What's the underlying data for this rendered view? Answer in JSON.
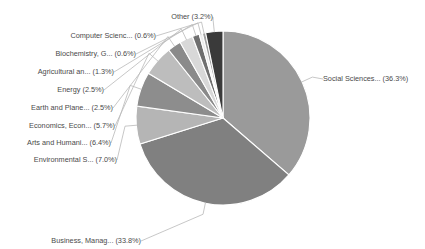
{
  "chart_data": {
    "type": "pie",
    "title": "",
    "subtitle": "",
    "xlabel": "",
    "ylabel": "",
    "legend_position": "none",
    "grid": false,
    "start_angle_deg": 90,
    "direction": "clockwise",
    "value_unit": "percent",
    "categories": [
      "Social Sciences...",
      "Business, Manag...",
      "Environmental S...",
      "Arts and Humani...",
      "Economics, Econ...",
      "Earth and Plane...",
      "Energy",
      "Agricultural an...",
      "Biochemistry, G...",
      "Computer Scienc...",
      "Other"
    ],
    "values": [
      36.3,
      33.8,
      7.0,
      6.4,
      5.7,
      2.5,
      2.5,
      1.3,
      0.6,
      0.6,
      3.2
    ],
    "colors": [
      "#9a9a9a",
      "#808080",
      "#b5b5b5",
      "#8d8d8d",
      "#bdbdbd",
      "#8a8a8a",
      "#d8d8d8",
      "#6f6f6f",
      "#ededed",
      "#a0a0a0",
      "#3a3a3a"
    ],
    "slices": [
      {
        "label": "Social Sciences...",
        "percent": "36.3%",
        "display": "Social Sciences... (36.3%)",
        "color": "#9a9a9a"
      },
      {
        "label": "Business, Manag...",
        "percent": "33.8%",
        "display": "Business, Manag... (33.8%)",
        "color": "#808080"
      },
      {
        "label": "Environmental S...",
        "percent": "7.0%",
        "display": "Environmental S... (7.0%)",
        "color": "#b5b5b5"
      },
      {
        "label": "Arts and Humani...",
        "percent": "6.4%",
        "display": "Arts and Humani... (6.4%)",
        "color": "#8d8d8d"
      },
      {
        "label": "Economics, Econ...",
        "percent": "5.7%",
        "display": "Economics, Econ... (5.7%)",
        "color": "#bdbdbd"
      },
      {
        "label": "Earth and Plane...",
        "percent": "2.5%",
        "display": "Earth and Plane... (2.5%)",
        "color": "#8a8a8a"
      },
      {
        "label": "Energy",
        "percent": "2.5%",
        "display": "Energy (2.5%)",
        "color": "#d8d8d8"
      },
      {
        "label": "Agricultural an...",
        "percent": "1.3%",
        "display": "Agricultural an... (1.3%)",
        "color": "#6f6f6f"
      },
      {
        "label": "Biochemistry, G...",
        "percent": "0.6%",
        "display": "Biochemistry, G... (0.6%)",
        "color": "#ededed"
      },
      {
        "label": "Computer Scienc...",
        "percent": "0.6%",
        "display": "Computer Scienc... (0.6%)",
        "color": "#a0a0a0"
      },
      {
        "label": "Other",
        "percent": "3.2%",
        "display": "Other (3.2%)",
        "color": "#3a3a3a"
      }
    ]
  },
  "geometry": {
    "cx": 223,
    "cy": 118,
    "r": 87
  }
}
